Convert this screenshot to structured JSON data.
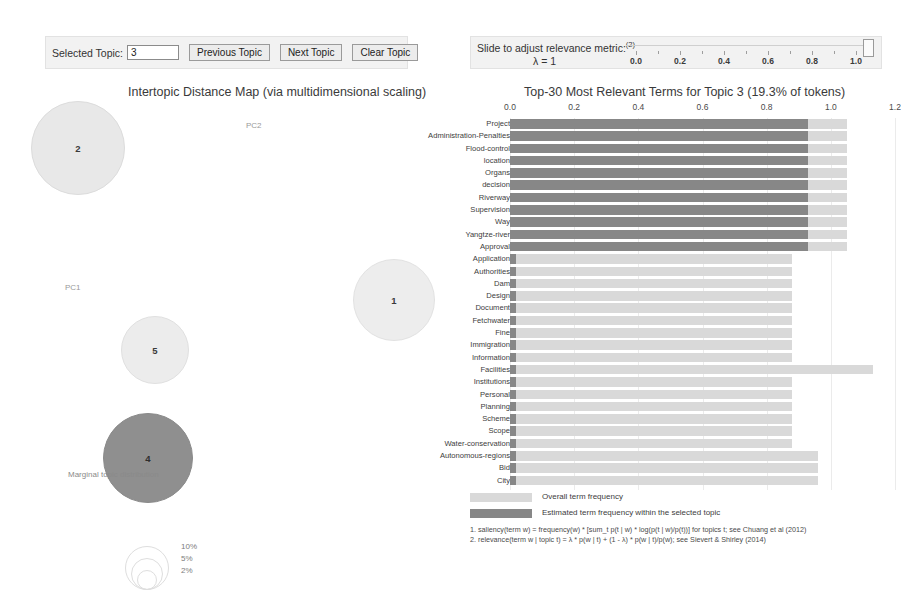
{
  "topic_controls": {
    "selected_topic_label": "Selected Topic:",
    "selected_topic_value": "3",
    "previous_topic": "Previous Topic",
    "next_topic": "Next Topic",
    "clear_topic": "Clear Topic"
  },
  "relevance_controls": {
    "title": "Slide to adjust relevance metric:",
    "title_superscript": "(2)",
    "lambda_label": "λ = 1",
    "lambda_value": 1,
    "tick_labels": [
      "0.0",
      "0.2",
      "0.4",
      "0.6",
      "0.8",
      "1.0"
    ],
    "tick_values": [
      0.0,
      0.2,
      0.4,
      0.6,
      0.8,
      1.0
    ],
    "handle_position": 1.0
  },
  "left_panel": {
    "heading": "Intertopic Distance Map (via multidimensional scaling)",
    "axis_x_label": "PC1",
    "axis_y_label": "PC2",
    "topics": [
      {
        "id": "2",
        "x": 78,
        "y": 48,
        "r": 47,
        "fill": "#e8e8e8",
        "stroke": "#dcdcdc",
        "selected": false
      },
      {
        "id": "5",
        "x": 155,
        "y": 250,
        "r": 34,
        "fill": "#ececec",
        "stroke": "#e0e0e0",
        "selected": false
      },
      {
        "id": "4",
        "x": 148,
        "y": 358,
        "r": 45,
        "fill": "#8f8f8f",
        "stroke": "#8a8a8a",
        "selected": false
      },
      {
        "id": "1",
        "x": 394,
        "y": 200,
        "r": 41,
        "fill": "#ededed",
        "stroke": "#e2e2e2",
        "selected": true
      }
    ],
    "marginal_legend": {
      "title": "Marginal topic distribution",
      "items": [
        {
          "label": "2%",
          "r": 9
        },
        {
          "label": "5%",
          "r": 15
        },
        {
          "label": "10%",
          "r": 21
        }
      ]
    }
  },
  "right_panel": {
    "heading": "Top-30 Most Relevant Terms for Topic 3 (19.3% of tokens)",
    "topic_number": 3,
    "topic_token_share": "19.3%",
    "legend": {
      "overall": "Overall term frequency",
      "topic": "Estimated term frequency within the selected topic"
    },
    "footnotes": [
      "1. saliency(term w) = frequency(w) * [sum_t p(t | w) * log(p(t | w)/p(t))] for topics t; see Chuang et al (2012)",
      "2. relevance(term w | topic t) = λ * p(w | t) + (1 - λ) * p(w | t)/p(w); see Sievert & Shirley (2014)"
    ]
  },
  "chart_data": {
    "type": "bar",
    "title": "Top-30 Most Relevant Terms for Topic 3 (19.3% of tokens)",
    "xlabel": "",
    "ylabel": "",
    "xlim": [
      0,
      1.2
    ],
    "tick_labels": [
      "0.0",
      "0.2",
      "0.4",
      "0.6",
      "0.8",
      "1.0",
      "1.2"
    ],
    "tick_values": [
      0.0,
      0.2,
      0.4,
      0.6,
      0.8,
      1.0,
      1.2
    ],
    "grid": true,
    "legend_position": "bottom",
    "orientation": "horizontal",
    "categories": [
      "Project",
      "Administration-Penalties",
      "Flood-control",
      "location",
      "Organs",
      "decision",
      "Riverway",
      "Supervision",
      "Way",
      "Yangtze-river",
      "Approval",
      "Application",
      "Authorities",
      "Dam",
      "Design",
      "Document",
      "Fetchwater",
      "Fine",
      "Immigration",
      "Information",
      "Facilities",
      "Institutions",
      "Personal",
      "Planning",
      "Scheme",
      "Scope",
      "Water-conservation",
      "Autonomous-regions",
      "Bid",
      "City"
    ],
    "series": [
      {
        "name": "Overall term frequency",
        "values": [
          1.05,
          1.05,
          1.05,
          1.05,
          1.05,
          1.05,
          1.05,
          1.05,
          1.05,
          1.05,
          1.05,
          0.88,
          0.88,
          0.88,
          0.88,
          0.88,
          0.88,
          0.88,
          0.88,
          0.88,
          1.13,
          0.88,
          0.88,
          0.88,
          0.88,
          0.88,
          0.88,
          0.96,
          0.96,
          0.96
        ]
      },
      {
        "name": "Estimated term frequency within the selected topic",
        "values": [
          0.93,
          0.93,
          0.93,
          0.93,
          0.93,
          0.93,
          0.93,
          0.93,
          0.93,
          0.93,
          0.93,
          0.02,
          0.02,
          0.02,
          0.02,
          0.02,
          0.02,
          0.02,
          0.02,
          0.02,
          0.02,
          0.02,
          0.02,
          0.02,
          0.02,
          0.02,
          0.02,
          0.02,
          0.02,
          0.02
        ]
      }
    ]
  }
}
